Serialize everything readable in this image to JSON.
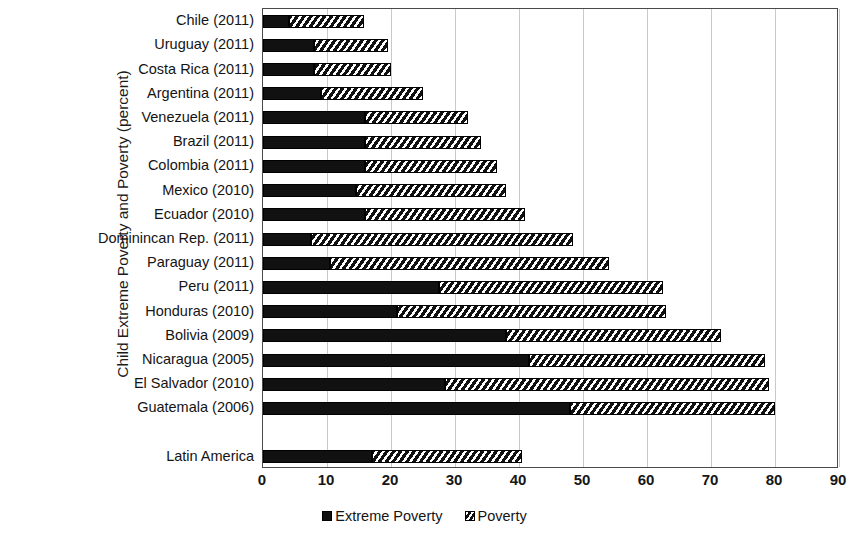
{
  "chart_data": {
    "type": "bar",
    "orientation": "horizontal",
    "stacked": true,
    "title": "",
    "ylabel": "Child Extreme Poverty and Poverty (percent)",
    "xlabel": "",
    "xlim": [
      0,
      90
    ],
    "xticks": [
      0,
      10,
      20,
      30,
      40,
      50,
      60,
      70,
      80,
      90
    ],
    "grid": true,
    "legend_position": "bottom",
    "legend": [
      "Extreme Poverty",
      "Poverty"
    ],
    "categories": [
      "Chile (2011)",
      "Uruguay (2011)",
      "Costa Rica (2011)",
      "Argentina (2011)",
      "Venezuela (2011)",
      "Brazil (2011)",
      "Colombia (2011)",
      "Mexico (2010)",
      "Ecuador (2010)",
      "Dominincan Rep. (2011)",
      "Paraguay (2011)",
      "Peru (2011)",
      "Honduras (2010)",
      "Bolivia (2009)",
      "Nicaragua (2005)",
      "El Salvador (2010)",
      "Guatemala (2006)",
      "",
      "Latin America"
    ],
    "series": [
      {
        "name": "Extreme Poverty",
        "color": "#111111",
        "values": [
          4,
          8,
          8,
          9,
          16,
          16,
          16,
          14.5,
          16,
          7.5,
          10.5,
          27.5,
          21,
          38,
          41.5,
          28.5,
          48,
          null,
          17
        ]
      },
      {
        "name": "Poverty",
        "color": "#111111",
        "pattern": "diagonal-hatch",
        "values": [
          11.8,
          11.5,
          12,
          16,
          16,
          18,
          20.5,
          23.5,
          25,
          41,
          43.5,
          35,
          42,
          33.5,
          37,
          50.5,
          32,
          null,
          23.5
        ]
      }
    ],
    "totals": [
      15.8,
      19.5,
      20.5,
      25,
      32,
      34,
      36.5,
      38,
      41,
      48.5,
      54,
      62.5,
      63,
      71.5,
      78.5,
      79,
      80,
      null,
      40.5
    ]
  },
  "axis": {
    "tick_labels": [
      "0",
      "10",
      "20",
      "30",
      "40",
      "50",
      "60",
      "70",
      "80",
      "90"
    ]
  }
}
